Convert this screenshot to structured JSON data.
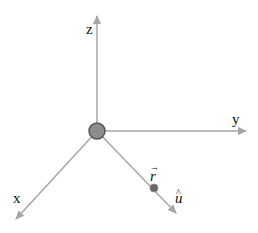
{
  "diagram": {
    "type": "3d-coordinate-axes",
    "axes": {
      "x": {
        "label": "x"
      },
      "y": {
        "label": "y"
      },
      "z": {
        "label": "z"
      }
    },
    "vectors": {
      "position": {
        "label": "r⃗",
        "base": "r",
        "accent": "→"
      },
      "unit": {
        "label": "û",
        "base": "u",
        "accent": "^"
      }
    },
    "colors": {
      "axis": "#a6a6a6",
      "origin_fill": "#8c8c8c",
      "origin_stroke": "#555555",
      "point_fill": "#666666",
      "text": "#111111"
    }
  }
}
